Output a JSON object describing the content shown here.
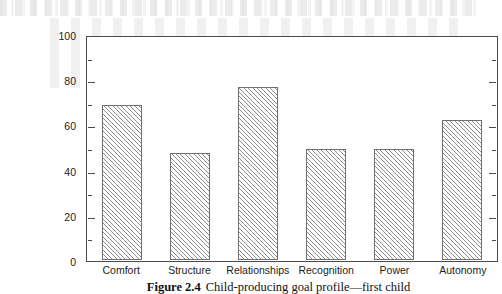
{
  "chart_data": {
    "type": "bar",
    "title": "",
    "categories": [
      "Comfort",
      "Structure",
      "Relationships",
      "Recognition",
      "Power",
      "Autonomy"
    ],
    "values": [
      70,
      48,
      78,
      50,
      50,
      63
    ],
    "xlabel": "",
    "ylabel": "",
    "ylim": [
      0,
      100
    ],
    "y_major_ticks": [
      0,
      20,
      40,
      60,
      80,
      100
    ],
    "y_minor_ticks": [
      10,
      30,
      50,
      70,
      90
    ],
    "y_tick_labels": [
      "0",
      "20",
      "40",
      "60",
      "80",
      "100"
    ],
    "grid": false,
    "legend": null,
    "bar_fill": "diagonal-hatch",
    "frame": "full-box"
  },
  "caption": {
    "number": "Figure 2.4",
    "text": "Child-producing goal profile—first child"
  },
  "colors": {
    "axis": "#4a4a4a",
    "bar_edge": "#6f6f6f",
    "hatch": "#8d8d8d",
    "text": "#1c1c1c",
    "background": "#ffffff"
  }
}
